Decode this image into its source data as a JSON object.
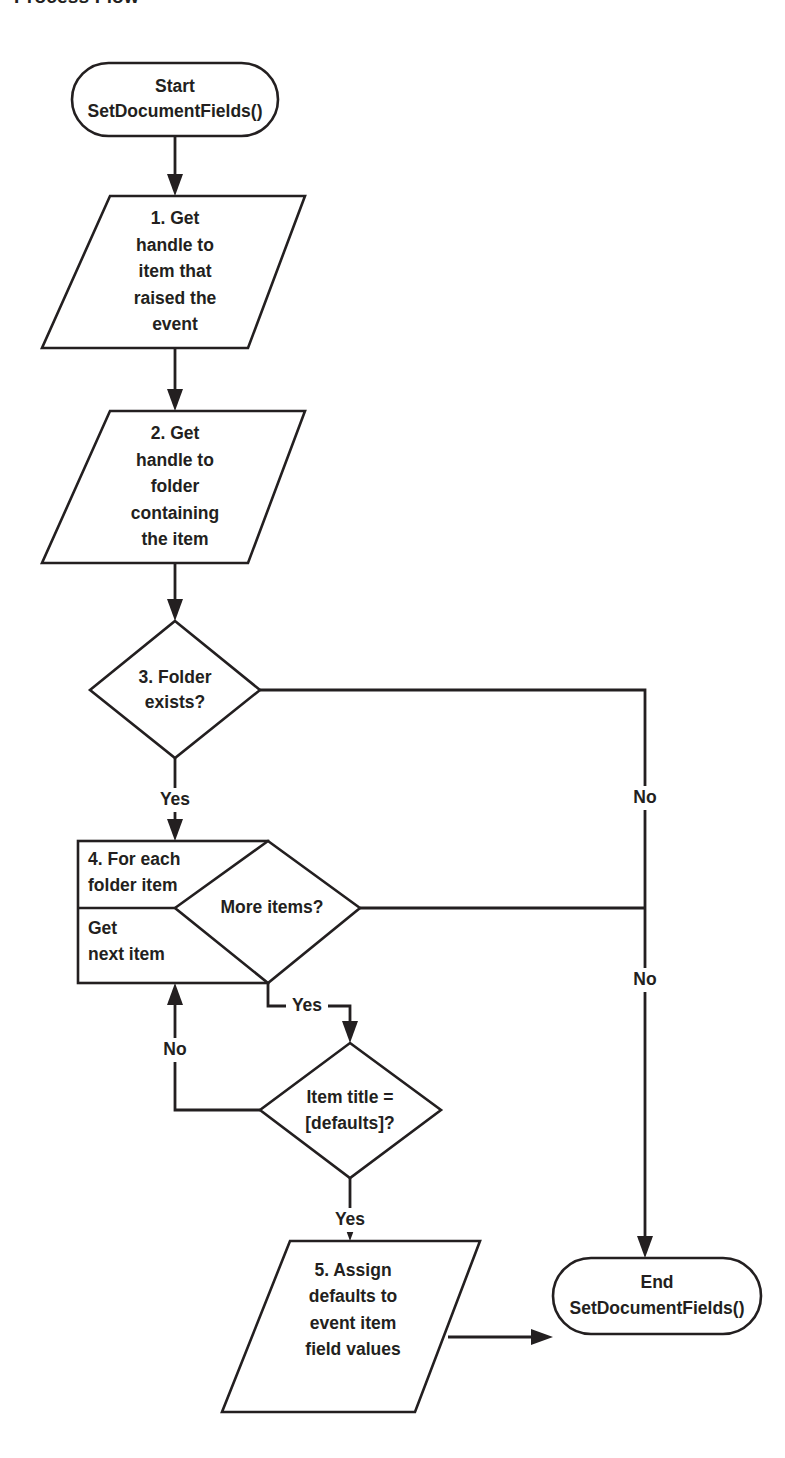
{
  "title": "Process Flow",
  "diagram": {
    "type": "flowchart",
    "orientation": "top-to-bottom",
    "nodes": [
      {
        "id": "start",
        "shape": "terminator",
        "lines": [
          "Start",
          "SetDocumentFields()"
        ]
      },
      {
        "id": "step1",
        "shape": "parallelogram",
        "lines": [
          "1. Get",
          "handle to",
          "item that",
          "raised the",
          "event"
        ]
      },
      {
        "id": "step2",
        "shape": "parallelogram",
        "lines": [
          "2. Get",
          "handle to",
          "folder",
          "containing",
          "the item"
        ]
      },
      {
        "id": "step3",
        "shape": "decision",
        "lines": [
          "3. Folder",
          "exists?"
        ]
      },
      {
        "id": "step4_loop_header",
        "shape": "process-loop-upper",
        "lines": [
          "4. For each",
          "folder item"
        ]
      },
      {
        "id": "step4_loop_body",
        "shape": "process-loop-lower",
        "lines": [
          "Get",
          "next item"
        ]
      },
      {
        "id": "more_items",
        "shape": "decision",
        "lines": [
          "More items?"
        ]
      },
      {
        "id": "item_title",
        "shape": "decision",
        "lines": [
          "Item title =",
          "[defaults]?"
        ]
      },
      {
        "id": "step5",
        "shape": "parallelogram",
        "lines": [
          "5. Assign",
          "defaults to",
          "event item",
          "field values"
        ]
      },
      {
        "id": "end",
        "shape": "terminator",
        "lines": [
          "End",
          "SetDocumentFields()"
        ]
      }
    ],
    "edge_labels": [
      {
        "id": "yes_folder_exists",
        "text": "Yes",
        "from": "step3",
        "to": "step4_loop_header"
      },
      {
        "id": "no_folder_exists",
        "text": "No",
        "from": "step3",
        "to": "end"
      },
      {
        "id": "no_more_items",
        "text": "No",
        "from": "more_items",
        "to": "end"
      },
      {
        "id": "yes_more_items",
        "text": "Yes",
        "from": "more_items",
        "to": "item_title"
      },
      {
        "id": "no_item_title",
        "text": "No",
        "from": "item_title",
        "to": "step4_loop_body"
      },
      {
        "id": "yes_item_title",
        "text": "Yes",
        "from": "item_title",
        "to": "step5"
      }
    ],
    "colors": {
      "stroke": "#231f20",
      "fill": "#ffffff",
      "background": "#ffffff"
    }
  }
}
